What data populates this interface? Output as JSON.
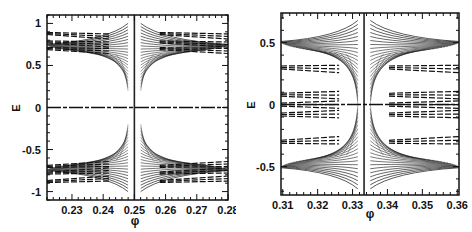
{
  "chart_data": [
    {
      "type": "line",
      "title": "",
      "description": "Hofstadter-butterfly-like energy spectrum E vs flux phi near phi = 1/4",
      "xlabel": "φ",
      "ylabel": "E",
      "xlim": [
        0.222,
        0.28
      ],
      "ylim": [
        -1.1,
        1.1
      ],
      "xticks": [
        0.23,
        0.24,
        0.25,
        0.26,
        0.27,
        0.28
      ],
      "xtick_labels": [
        "0.23",
        "0.24",
        "0.25",
        "0.26",
        "0.27",
        "0.28"
      ],
      "yticks": [
        -1,
        -0.5,
        0,
        0.5,
        1
      ],
      "ytick_labels": [
        "-1",
        "-0.5",
        "0",
        "0.5",
        "1"
      ],
      "grid": false,
      "legend": null,
      "singular_flux": 0.25,
      "features": {
        "vertical_line_at": 0.25,
        "fan_upper": {
          "outer_E": 1.0,
          "inner_E": 0.2
        },
        "fan_lower": {
          "outer_E": -1.0,
          "inner_E": -0.2
        },
        "side_bands": [
          0.88,
          0.78,
          0.7,
          -0.7,
          -0.78,
          -0.88
        ],
        "center_band_E": 0.0
      }
    },
    {
      "type": "line",
      "title": "",
      "description": "Hofstadter-butterfly-like energy spectrum E vs flux phi near phi = 1/3",
      "xlabel": "φ",
      "ylabel": "E",
      "xlim": [
        0.3095,
        0.3605
      ],
      "ylim": [
        -0.73,
        0.74
      ],
      "xticks": [
        0.31,
        0.32,
        0.33,
        0.34,
        0.35,
        0.36
      ],
      "xtick_labels": [
        "0.31",
        "0.32",
        "0.33",
        "0.34",
        "0.35",
        "0.36"
      ],
      "yticks": [
        -0.5,
        0,
        0.5
      ],
      "ytick_labels": [
        "-0.5",
        "0",
        "0.5"
      ],
      "grid": false,
      "legend": null,
      "singular_flux": 0.3333,
      "features": {
        "vertical_line_at": 0.3333,
        "fan_upper": {
          "outer_E": 0.68,
          "inner_E": 0.0
        },
        "fan_lower": {
          "outer_E": -0.68,
          "inner_E": 0.0
        },
        "side_bands": [
          0.3,
          0.08,
          0.0,
          -0.08,
          -0.3
        ],
        "center_band_E": 0.0
      }
    }
  ],
  "panels": {
    "left": {
      "xlabel": "φ",
      "ylabel": "E"
    },
    "right": {
      "xlabel": "φ",
      "ylabel": "E"
    }
  }
}
